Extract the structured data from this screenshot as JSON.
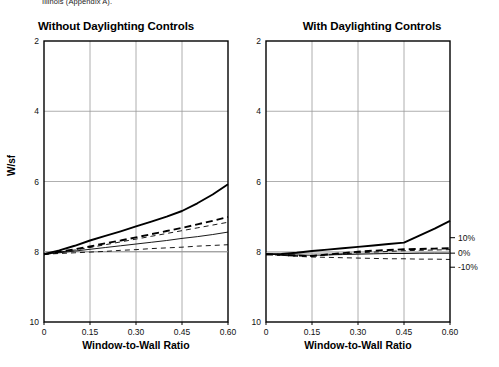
{
  "document": {
    "caption_tail": "Illinois (Appendix A)."
  },
  "charts": [
    {
      "id": "without-daylighting",
      "title": "Without Daylighting Controls",
      "xlabel": "Window-to-Wall Ratio",
      "ylabel": "W/sf",
      "xticks": [
        "0",
        "0.15",
        "0.30",
        "0.45",
        "0.60"
      ],
      "yticks": [
        "10",
        "8",
        "6",
        "4",
        "2"
      ]
    },
    {
      "id": "with-daylighting",
      "title": "With Daylighting Controls",
      "xlabel": "Window-to-Wall Ratio",
      "ylabel": "W/sf",
      "xticks": [
        "0",
        "0.15",
        "0.30",
        "0.45",
        "0.60"
      ],
      "yticks": [
        "10",
        "8",
        "6",
        "4",
        "2"
      ],
      "secondary_axis_ticks": [
        "10%",
        "0%",
        "-10%"
      ]
    }
  ],
  "chart_data": [
    {
      "type": "line",
      "title": "Without Daylighting Controls",
      "xlabel": "Window-to-Wall Ratio",
      "ylabel": "W/sf",
      "xlim": [
        0,
        0.6
      ],
      "ylim": [
        2,
        10
      ],
      "xticks": [
        0,
        0.15,
        0.3,
        0.45,
        0.6
      ],
      "yticks": [
        2,
        4,
        6,
        8,
        10
      ],
      "grid": true,
      "legend": "none",
      "reference_line": 4.0,
      "x": [
        0,
        0.05,
        0.1,
        0.15,
        0.2,
        0.25,
        0.3,
        0.35,
        0.4,
        0.45,
        0.5,
        0.55,
        0.6
      ],
      "series": [
        {
          "name": "series-1-thick-solid",
          "style": "solid",
          "width": "thick",
          "values": [
            3.93,
            4.04,
            4.17,
            4.32,
            4.45,
            4.58,
            4.72,
            4.86,
            5.0,
            5.16,
            5.38,
            5.63,
            5.92
          ]
        },
        {
          "name": "series-2-thick-dashed",
          "style": "dashed",
          "width": "thick",
          "values": [
            3.93,
            4.0,
            4.07,
            4.15,
            4.24,
            4.32,
            4.41,
            4.5,
            4.59,
            4.68,
            4.78,
            4.88,
            4.99
          ]
        },
        {
          "name": "series-3-thin-dashed",
          "style": "dashed",
          "width": "thin",
          "values": [
            3.93,
            3.99,
            4.05,
            4.12,
            4.2,
            4.28,
            4.36,
            4.44,
            4.52,
            4.6,
            4.68,
            4.76,
            4.84
          ]
        },
        {
          "name": "series-4-thin-solid",
          "style": "solid",
          "width": "thin",
          "values": [
            3.93,
            3.97,
            4.02,
            4.07,
            4.12,
            4.17,
            4.22,
            4.27,
            4.32,
            4.38,
            4.43,
            4.49,
            4.56
          ]
        },
        {
          "name": "series-5-thin-dashed-low",
          "style": "dashed",
          "width": "thin",
          "values": [
            3.93,
            3.95,
            3.97,
            3.99,
            4.01,
            4.04,
            4.06,
            4.09,
            4.11,
            4.13,
            4.16,
            4.18,
            4.2
          ]
        }
      ]
    },
    {
      "type": "line",
      "title": "With Daylighting Controls",
      "xlabel": "Window-to-Wall Ratio",
      "ylabel": "W/sf",
      "xlim": [
        0,
        0.6
      ],
      "ylim": [
        2,
        10
      ],
      "xticks": [
        0,
        0.15,
        0.3,
        0.45,
        0.6
      ],
      "yticks": [
        2,
        4,
        6,
        8,
        10
      ],
      "secondary_yticks": [
        "10%",
        "0%",
        "-10%"
      ],
      "secondary_ytick_values": [
        4.4,
        3.96,
        3.56
      ],
      "grid": true,
      "legend": "none",
      "reference_line": 3.96,
      "x": [
        0,
        0.05,
        0.1,
        0.15,
        0.2,
        0.25,
        0.3,
        0.35,
        0.4,
        0.45,
        0.5,
        0.55,
        0.6
      ],
      "series": [
        {
          "name": "series-1-thick-solid",
          "style": "solid",
          "width": "thick",
          "values": [
            3.93,
            3.94,
            3.97,
            4.02,
            4.06,
            4.1,
            4.14,
            4.18,
            4.22,
            4.26,
            4.46,
            4.66,
            4.88
          ]
        },
        {
          "name": "series-2-thick-dashed",
          "style": "dashed",
          "width": "thick",
          "values": [
            3.93,
            3.91,
            3.89,
            3.88,
            3.92,
            3.96,
            4.0,
            4.03,
            4.05,
            4.07,
            4.08,
            4.09,
            4.1
          ]
        },
        {
          "name": "series-3-thin-dashed",
          "style": "dashed",
          "width": "thin",
          "values": [
            3.93,
            3.91,
            3.89,
            3.88,
            3.91,
            3.94,
            3.97,
            3.99,
            4.01,
            4.03,
            4.04,
            4.05,
            4.06
          ]
        },
        {
          "name": "series-4-thin-solid",
          "style": "solid",
          "width": "thin",
          "values": [
            3.93,
            3.92,
            3.91,
            3.9,
            3.91,
            3.92,
            3.93,
            3.94,
            3.95,
            3.95,
            3.96,
            3.96,
            3.96
          ]
        },
        {
          "name": "series-5-thin-dashed-low",
          "style": "dashed",
          "width": "thin",
          "values": [
            3.93,
            3.9,
            3.87,
            3.85,
            3.84,
            3.83,
            3.82,
            3.81,
            3.8,
            3.8,
            3.79,
            3.79,
            3.78
          ]
        }
      ]
    }
  ]
}
